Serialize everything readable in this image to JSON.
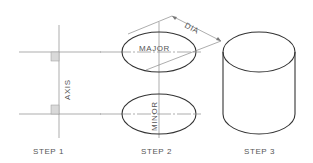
{
  "steps": [
    {
      "label": "STEP 1",
      "annotation": "AXIS"
    },
    {
      "label": "STEP 2",
      "annotations": {
        "major": "MAJOR",
        "minor": "MINOR",
        "dimension": "DIA"
      }
    },
    {
      "label": "STEP 3"
    }
  ],
  "colors": {
    "line_dark": "#333333",
    "line_light": "#8a8a8a",
    "fill_square": "#d9d9d9",
    "text": "#555555"
  }
}
